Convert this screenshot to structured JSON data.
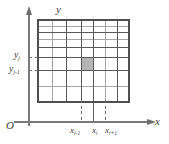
{
  "figure": {
    "type": "coordinate-grid-diagram",
    "axes": {
      "x_label": "x",
      "y_label": "y",
      "origin_label": "O"
    },
    "x_ticks": [
      {
        "id": "x-i-minus-1",
        "base": "x",
        "sub": "i-1",
        "px": 81
      },
      {
        "id": "x-i",
        "base": "x",
        "sub": "i",
        "px": 93
      },
      {
        "id": "x-i-plus-1",
        "base": "x",
        "sub": "i+1",
        "px": 105
      }
    ],
    "y_ticks": [
      {
        "id": "y-j",
        "base": "y",
        "sub": "j",
        "px": 57
      },
      {
        "id": "y-j-minus-1",
        "base": "y",
        "sub": "j-1",
        "px": 70
      }
    ],
    "grid": {
      "left": 38,
      "right": 129,
      "top": 20,
      "bottom": 102,
      "vertical_lines": [
        38,
        52,
        66,
        81,
        93,
        105,
        117,
        129
      ],
      "horizontal_lines": [
        20,
        26,
        32,
        39,
        47,
        57,
        70,
        86,
        102
      ]
    },
    "highlight_cell": {
      "x0": 81,
      "x1": 93,
      "y0": 57,
      "y1": 70,
      "fill": "#b4b4b4"
    },
    "colors": {
      "axis": "#7a7a7a",
      "grid": "#595959",
      "grid_light": "#9a9a9a",
      "dash": "#6a6a6a",
      "text": "#3a3a3a",
      "highlight": "#b4b4b4",
      "background": "#ffffff"
    }
  }
}
